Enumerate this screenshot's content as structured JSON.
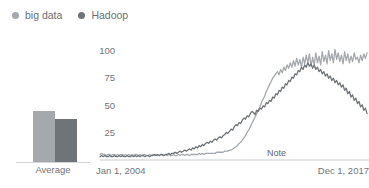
{
  "legend": {
    "items": [
      {
        "label": "big data",
        "color": "#a5a9ad",
        "dot": "legend-dot-big-data"
      },
      {
        "label": "Hadoop",
        "color": "#6f7479",
        "dot": "legend-dot-hadoop"
      }
    ]
  },
  "average_widget": {
    "label": "Average",
    "bars": [
      {
        "name": "big data",
        "value": 33,
        "color": "#a5a9ad"
      },
      {
        "name": "Hadoop",
        "value": 28,
        "color": "#6f7479"
      }
    ],
    "max": 40
  },
  "axis": {
    "y_ticks": [
      "100",
      "75",
      "50",
      "25"
    ],
    "x_start": "Jan 1, 2004",
    "x_end": "Dec 1, 2017",
    "note": "Note"
  },
  "colors": {
    "big_data": "#a5a9ad",
    "hadoop": "#6f7479",
    "axis_line": "#c8cacc",
    "text": "#70757a",
    "background": "#ffffff"
  },
  "chart_data": {
    "type": "line",
    "title": "",
    "xlabel": "",
    "ylabel": "",
    "ylim": [
      0,
      105
    ],
    "grid": false,
    "legend_position": "top-left",
    "x_axis_labels": [
      "Jan 1, 2004",
      "Dec 1, 2017"
    ],
    "y_tick_values": [
      25,
      50,
      75,
      100
    ],
    "annotations": [
      {
        "text": "Note",
        "x_frac": 0.72,
        "y": 0
      }
    ],
    "x": [
      0,
      1,
      2,
      3,
      4,
      5,
      6,
      7,
      8,
      9,
      10,
      11,
      12,
      13,
      14,
      15,
      16,
      17,
      18,
      19,
      20,
      21,
      22,
      23,
      24,
      25,
      26,
      27,
      28,
      29,
      30,
      31,
      32,
      33,
      34,
      35,
      36,
      37,
      38,
      39,
      40,
      41,
      42,
      43,
      44,
      45,
      46,
      47,
      48,
      49,
      50,
      51,
      52,
      53,
      54,
      55,
      56,
      57,
      58,
      59,
      60,
      61,
      62,
      63,
      64,
      65,
      66,
      67,
      68,
      69,
      70,
      71,
      72,
      73,
      74,
      75,
      76,
      77,
      78,
      79,
      80,
      81,
      82,
      83,
      84,
      85,
      86,
      87,
      88,
      89,
      90,
      91,
      92,
      93,
      94,
      95,
      96,
      97,
      98,
      99,
      100,
      101,
      102,
      103,
      104,
      105,
      106,
      107,
      108,
      109,
      110,
      111,
      112,
      113,
      114,
      115,
      116,
      117,
      118,
      119,
      120,
      121,
      122,
      123,
      124,
      125,
      126,
      127,
      128,
      129,
      130,
      131,
      132,
      133,
      134,
      135,
      136,
      137,
      138,
      139,
      140,
      141,
      142,
      143,
      144,
      145,
      146,
      147,
      148,
      149,
      150,
      151,
      152,
      153,
      154,
      155,
      156,
      157,
      158,
      159,
      160,
      161,
      162,
      163,
      164,
      165,
      166,
      167
    ],
    "series": [
      {
        "name": "big data",
        "color": "#a5a9ad",
        "values": [
          5,
          6,
          5,
          5,
          4,
          5,
          5,
          4,
          5,
          5,
          4,
          5,
          4,
          5,
          5,
          4,
          5,
          4,
          5,
          4,
          5,
          4,
          5,
          5,
          4,
          5,
          4,
          5,
          5,
          4,
          4,
          5,
          4,
          5,
          4,
          5,
          4,
          4,
          5,
          4,
          4,
          5,
          4,
          5,
          4,
          4,
          5,
          4,
          4,
          5,
          4,
          5,
          5,
          4,
          5,
          5,
          4,
          5,
          5,
          5,
          5,
          5,
          6,
          5,
          6,
          5,
          6,
          6,
          6,
          6,
          6,
          6,
          6,
          7,
          7,
          7,
          7,
          7,
          8,
          8,
          8,
          9,
          9,
          10,
          11,
          12,
          13,
          15,
          16,
          18,
          20,
          22,
          25,
          27,
          30,
          33,
          36,
          39,
          42,
          45,
          48,
          52,
          55,
          58,
          62,
          65,
          68,
          71,
          74,
          76,
          78,
          80,
          77,
          82,
          79,
          84,
          81,
          86,
          83,
          88,
          84,
          90,
          85,
          92,
          86,
          91,
          84,
          93,
          87,
          95,
          88,
          96,
          85,
          93,
          86,
          97,
          88,
          94,
          86,
          98,
          89,
          95,
          87,
          99,
          90,
          96,
          88,
          100,
          91,
          97,
          89,
          95,
          87,
          98,
          90,
          96,
          88,
          94,
          89,
          97,
          91,
          93,
          88,
          95,
          90,
          96,
          92,
          97
        ]
      },
      {
        "name": "Hadoop",
        "color": "#6f7479",
        "values": [
          3,
          4,
          3,
          4,
          3,
          3,
          4,
          3,
          3,
          4,
          3,
          3,
          4,
          3,
          4,
          3,
          3,
          4,
          3,
          3,
          4,
          3,
          4,
          3,
          4,
          3,
          4,
          4,
          3,
          4,
          4,
          3,
          4,
          4,
          5,
          4,
          5,
          4,
          5,
          5,
          4,
          5,
          5,
          6,
          5,
          6,
          6,
          7,
          6,
          7,
          8,
          7,
          8,
          9,
          8,
          9,
          10,
          9,
          11,
          10,
          12,
          11,
          13,
          12,
          14,
          13,
          15,
          16,
          15,
          17,
          16,
          18,
          19,
          18,
          20,
          21,
          20,
          22,
          23,
          25,
          24,
          26,
          28,
          27,
          30,
          32,
          31,
          34,
          33,
          36,
          38,
          37,
          40,
          39,
          42,
          44,
          43,
          41,
          45,
          44,
          47,
          46,
          49,
          48,
          52,
          51,
          54,
          53,
          57,
          56,
          60,
          59,
          63,
          62,
          66,
          65,
          69,
          68,
          72,
          71,
          75,
          74,
          78,
          77,
          81,
          80,
          84,
          82,
          86,
          84,
          88,
          85,
          87,
          83,
          86,
          82,
          84,
          80,
          82,
          78,
          80,
          76,
          78,
          74,
          76,
          72,
          74,
          70,
          72,
          68,
          70,
          66,
          68,
          63,
          65,
          60,
          62,
          57,
          59,
          54,
          56,
          51,
          53,
          48,
          50,
          45,
          47,
          42
        ]
      }
    ]
  }
}
